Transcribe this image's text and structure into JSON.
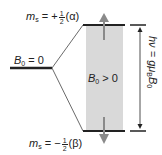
{
  "diagram": {
    "levels": {
      "degenerate": {
        "label_main": "B",
        "label_sub": "0",
        "label_rest": " = 0"
      },
      "upper": {
        "label_m": "m",
        "label_sub": "s",
        "label_eq": " = +",
        "frac_num": "1",
        "frac_den": "2",
        "label_state": "(α)"
      },
      "lower": {
        "label_m": "m",
        "label_sub": "s",
        "label_eq": " = −",
        "frac_num": "1",
        "frac_den": "2",
        "label_state": "(β)"
      }
    },
    "field_region": {
      "label_main": "B",
      "label_sub": "0",
      "label_rest": " > 0"
    },
    "energy_gap": {
      "label_hv": "hν = gμ",
      "label_sub_b": "B",
      "label_b0": "B",
      "label_sub_0": "0"
    },
    "colors": {
      "line": "#222222",
      "box_fill": "#d9d9d9",
      "arrow_gray": "#8a8a8a"
    }
  }
}
